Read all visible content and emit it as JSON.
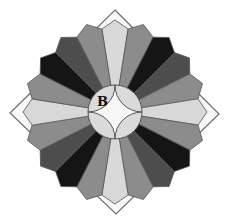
{
  "figure": {
    "type": "dresden-plate-quilt-block",
    "center_label": "B",
    "wedge_count": 20,
    "wedge_pattern": [
      "light",
      "medium",
      "black",
      "dark",
      "medium"
    ],
    "colors": {
      "diamond_fill": "#f8f8f8",
      "diamond_stroke": "#6e6e6e",
      "light": "#d8d8d8",
      "medium": "#8c8c8c",
      "dark": "#4d4d4d",
      "black": "#151515",
      "wedge_stroke": "#555555",
      "center_circle": "#dadada",
      "center_star": "#f6f6f6"
    }
  }
}
